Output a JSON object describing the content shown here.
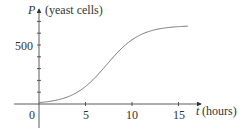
{
  "chart_data": {
    "type": "line",
    "title": "",
    "xlabel_var": "t",
    "xlabel_unit": "(hours)",
    "ylabel_var": "P",
    "ylabel_unit": "(yeast cells)",
    "x_ticks": [
      5,
      10,
      15
    ],
    "x_tick_labels": [
      "5",
      "10",
      "15"
    ],
    "origin_label": "0",
    "y_tick_step": 100,
    "y_labeled_ticks": [
      500
    ],
    "y_tick_labels": [
      "500"
    ],
    "xlim": [
      0,
      17
    ],
    "ylim": [
      0,
      800
    ],
    "grid": false,
    "series": [
      {
        "name": "P(t)",
        "x": [
          0,
          1,
          2,
          3,
          4,
          5,
          6,
          7,
          8,
          9,
          10,
          11,
          12,
          13,
          14,
          15,
          16
        ],
        "values": [
          15,
          30,
          55,
          100,
          165,
          255,
          360,
          460,
          545,
          600,
          635,
          652,
          660,
          664,
          665,
          666,
          666
        ]
      }
    ]
  },
  "axes": {
    "x_var": "t",
    "x_unit": "(hours)",
    "y_var": "P",
    "y_unit": "(yeast cells)",
    "origin": "0",
    "x_ticks": [
      "5",
      "10",
      "15"
    ],
    "y_500": "500"
  },
  "colors": {
    "axis": "#333333",
    "curve": "#777777"
  }
}
